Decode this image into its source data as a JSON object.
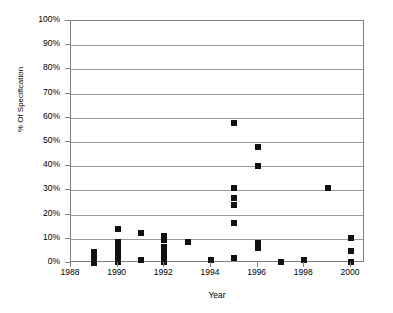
{
  "chart_data": {
    "type": "scatter",
    "title": "",
    "xlabel": "Year",
    "ylabel": "% Of Specification",
    "xlim": [
      1988,
      2000.6
    ],
    "ylim": [
      0,
      1.0
    ],
    "grid": true,
    "legend": "none",
    "marker": "filled-square",
    "marker_color": "#111111",
    "y_tick_labels": [
      "100%",
      "90%",
      "80%",
      "70%",
      "60%",
      "50%",
      "40%",
      "30%",
      "20%",
      "10%",
      "0%"
    ],
    "y_tick_values": [
      1.0,
      0.9,
      0.8,
      0.7,
      0.6,
      0.5,
      0.4,
      0.3,
      0.2,
      0.1,
      0.0
    ],
    "x_tick_labels": [
      "1988",
      "1990",
      "1992",
      "1994",
      "1996",
      "1998",
      "2000"
    ],
    "x_tick_values": [
      1988,
      1990,
      1992,
      1994,
      1996,
      1998,
      2000
    ],
    "points": [
      {
        "x": 1989,
        "y": 0.045,
        "label": "4.5%"
      },
      {
        "x": 1989,
        "y": 0.03,
        "label": "3%"
      },
      {
        "x": 1989,
        "y": 0.015,
        "label": "1.5%"
      },
      {
        "x": 1989,
        "y": 0.002,
        "label": "0.2%"
      },
      {
        "x": 1990,
        "y": 0.14,
        "label": "14%"
      },
      {
        "x": 1990,
        "y": 0.085,
        "label": "8.5%"
      },
      {
        "x": 1990,
        "y": 0.065,
        "label": "6.5%"
      },
      {
        "x": 1990,
        "y": 0.045,
        "label": "4.5%"
      },
      {
        "x": 1990,
        "y": 0.025,
        "label": "2.5%"
      },
      {
        "x": 1990,
        "y": 0.005,
        "label": "0.5%"
      },
      {
        "x": 1991,
        "y": 0.125,
        "label": "12.5%"
      },
      {
        "x": 1991,
        "y": 0.012,
        "label": "1.2%"
      },
      {
        "x": 1992,
        "y": 0.113,
        "label": "11.3%"
      },
      {
        "x": 1992,
        "y": 0.095,
        "label": "9.5%"
      },
      {
        "x": 1992,
        "y": 0.066,
        "label": "6.6%"
      },
      {
        "x": 1992,
        "y": 0.048,
        "label": "4.8%"
      },
      {
        "x": 1992,
        "y": 0.028,
        "label": "2.8%"
      },
      {
        "x": 1992,
        "y": 0.005,
        "label": "0.5%"
      },
      {
        "x": 1993,
        "y": 0.085,
        "label": "8.5%"
      },
      {
        "x": 1994,
        "y": 0.012,
        "label": "1.2%"
      },
      {
        "x": 1995,
        "y": 0.58,
        "label": "58%"
      },
      {
        "x": 1995,
        "y": 0.31,
        "label": "31%"
      },
      {
        "x": 1995,
        "y": 0.27,
        "label": "27%"
      },
      {
        "x": 1995,
        "y": 0.24,
        "label": "24%"
      },
      {
        "x": 1995,
        "y": 0.165,
        "label": "16.5%"
      },
      {
        "x": 1995,
        "y": 0.022,
        "label": "2.2%"
      },
      {
        "x": 1996,
        "y": 0.48,
        "label": "48%"
      },
      {
        "x": 1996,
        "y": 0.402,
        "label": "40%"
      },
      {
        "x": 1996,
        "y": 0.082,
        "label": "8.2%"
      },
      {
        "x": 1996,
        "y": 0.062,
        "label": "6.2%"
      },
      {
        "x": 1997,
        "y": 0.005,
        "label": "0.5%"
      },
      {
        "x": 1998,
        "y": 0.012,
        "label": "1.2%"
      },
      {
        "x": 1999,
        "y": 0.31,
        "label": "31%"
      },
      {
        "x": 2000,
        "y": 0.105,
        "label": "10.5%"
      },
      {
        "x": 2000,
        "y": 0.05,
        "label": "5%"
      },
      {
        "x": 2000,
        "y": 0.004,
        "label": "0.4%"
      }
    ]
  },
  "style": {
    "axis_color": "#808080",
    "grid_color": "#9a9a9a",
    "marker_color": "#111111",
    "background": "#ffffff"
  }
}
